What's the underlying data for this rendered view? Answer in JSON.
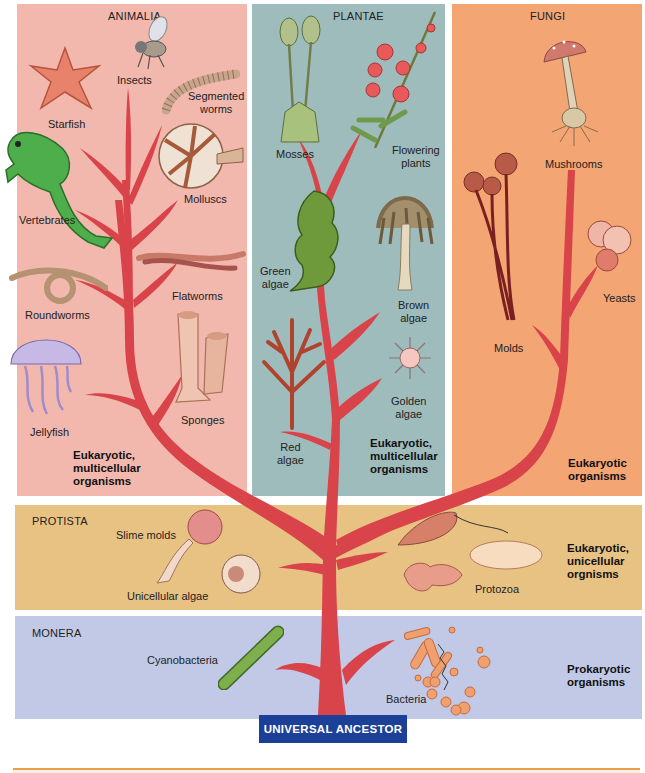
{
  "root": {
    "label": "UNIVERSAL ANCESTOR",
    "color": "#1c3f97"
  },
  "kingdoms": {
    "animalia": {
      "name": "ANIMALIA",
      "color": "#f2b8ae",
      "description": "Eukaryotic,\nmulticellular\norganisms",
      "organisms": [
        "Insects",
        "Starfish",
        "Segmented worms",
        "Molluscs",
        "Vertebrates",
        "Flatworms",
        "Roundworms",
        "Sponges",
        "Jellyfish"
      ]
    },
    "plantae": {
      "name": "PLANTAE",
      "color": "#9fbcbd",
      "description": "Eukaryotic,\nmulticellular\norganisms",
      "organisms": [
        "Mosses",
        "Flowering plants",
        "Green algae",
        "Brown algae",
        "Red algae",
        "Golden algae"
      ]
    },
    "fungi": {
      "name": "FUNGI",
      "color": "#f3a574",
      "description": "Eukaryotic\norganisms",
      "organisms": [
        "Mushrooms",
        "Yeasts",
        "Molds"
      ]
    },
    "protista": {
      "name": "PROTISTA",
      "color": "#e8c282",
      "description": "Eukaryotic,\nunicellular\norgnisms",
      "organisms": [
        "Slime molds",
        "Unicellular algae",
        "Protozoa"
      ]
    },
    "monera": {
      "name": "MONERA",
      "color": "#c2c9e6",
      "description": "Prokaryotic\norganisms",
      "organisms": [
        "Cyanobacteria",
        "Bacteria"
      ]
    }
  },
  "labels": {
    "insects": "Insects",
    "starfish": "Starfish",
    "segmented_worms": "Segmented\nworms",
    "molluscs": "Molluscs",
    "vertebrates": "Vertebrates",
    "flatworms": "Flatworms",
    "roundworms": "Roundworms",
    "sponges": "Sponges",
    "jellyfish": "Jellyfish",
    "mosses": "Mosses",
    "flowering_plants": "Flowering\nplants",
    "green_algae": "Green\nalgae",
    "brown_algae": "Brown\nalgae",
    "red_algae": "Red\nalgae",
    "golden_algae": "Golden\nalgae",
    "mushrooms": "Mushrooms",
    "yeasts": "Yeasts",
    "molds": "Molds",
    "slime_molds": "Slime molds",
    "unicellular_algae": "Unicellular algae",
    "protozoa": "Protozoa",
    "cyanobacteria": "Cyanobacteria",
    "bacteria": "Bacteria"
  },
  "colors": {
    "branch": "#d9434a",
    "branch_light": "#e8737a",
    "rule": "#ef9a4c"
  }
}
